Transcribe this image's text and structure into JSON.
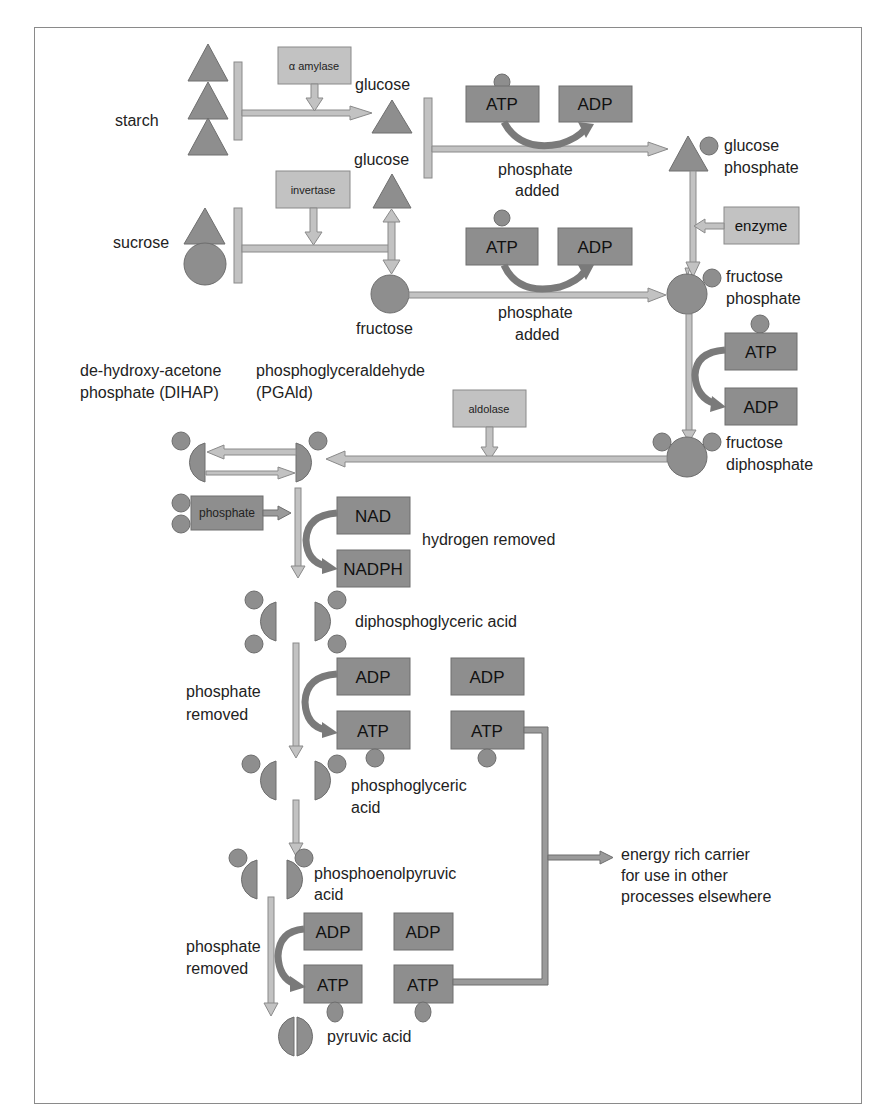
{
  "colors": {
    "molecule": "#8e8e8e",
    "enzyme_box": "#c2c2c2",
    "arrow": "#c2c2c2",
    "curved_arrow": "#7a7a7a",
    "frame": "#8a8a8a"
  },
  "substrates": {
    "starch": "starch",
    "sucrose": "sucrose",
    "glucose_1": "glucose",
    "glucose_2": "glucose",
    "fructose": "fructose",
    "glucose_phosphate_1": "glucose",
    "glucose_phosphate_2": "phosphate",
    "fructose_phosphate_1": "fructose",
    "fructose_phosphate_2": "phosphate",
    "fructose_diphosphate_1": "fructose",
    "fructose_diphosphate_2": "diphosphate",
    "dihap_1": "de-hydroxy-acetone",
    "dihap_2": "phosphate (DIHAP)",
    "pgald_1": "phosphoglyceraldehyde",
    "pgald_2": "(PGAld)",
    "diphosphoglyceric": "diphosphoglyceric acid",
    "phosphoglyceric_1": "phosphoglyceric",
    "phosphoglyceric_2": "acid",
    "pep_1": "phosphoenolpyruvic",
    "pep_2": "acid",
    "pyruvic": "pyruvic acid"
  },
  "enzymes": {
    "amylase": "α amylase",
    "invertase": "invertase",
    "enzyme": "enzyme",
    "aldolase": "aldolase",
    "phosphate": "phosphate"
  },
  "cofactors": {
    "atp": "ATP",
    "adp": "ADP",
    "nad": "NAD",
    "nadph": "NADPH"
  },
  "annotations": {
    "phosphate_added_1a": "phosphate",
    "phosphate_added_1b": "added",
    "phosphate_added_2a": "phosphate",
    "phosphate_added_2b": "added",
    "hydrogen_removed": "hydrogen removed",
    "phosphate_removed_1a": "phosphate",
    "phosphate_removed_1b": "removed",
    "phosphate_removed_2a": "phosphate",
    "phosphate_removed_2b": "removed",
    "energy_1": "energy rich carrier",
    "energy_2": "for use in other",
    "energy_3": "processes elsewhere"
  }
}
